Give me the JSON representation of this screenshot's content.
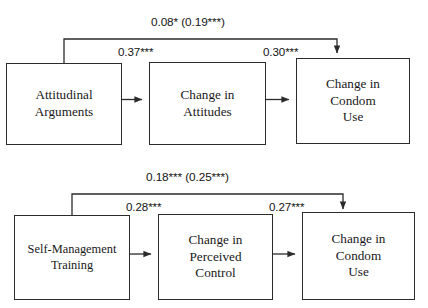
{
  "diagram": {
    "type": "path-diagram",
    "panels": [
      {
        "id": "panel-attitudinal",
        "nodes": [
          {
            "id": "attitudinal-arguments",
            "label": "Attitudinal\nArguments"
          },
          {
            "id": "change-in-attitudes",
            "label": "Change in\nAttitudes"
          },
          {
            "id": "change-in-condom-use",
            "label": "Change in\nCondom\nUse"
          }
        ],
        "paths": [
          {
            "id": "direct-effect",
            "from": "attitudinal-arguments",
            "to": "change-in-condom-use",
            "label": "0.08* (0.19***)"
          },
          {
            "id": "a-path",
            "from": "attitudinal-arguments",
            "to": "change-in-attitudes",
            "label": "0.37***"
          },
          {
            "id": "b-path",
            "from": "change-in-attitudes",
            "to": "change-in-condom-use",
            "label": "0.30***"
          }
        ]
      },
      {
        "id": "panel-self-management",
        "nodes": [
          {
            "id": "self-management-training",
            "label": "Self-Management\nTraining"
          },
          {
            "id": "change-in-perceived-control",
            "label": "Change in\nPerceived\nControl"
          },
          {
            "id": "change-in-condom-use-2",
            "label": "Change in\nCondom\nUse"
          }
        ],
        "paths": [
          {
            "id": "direct-effect-2",
            "from": "self-management-training",
            "to": "change-in-condom-use-2",
            "label": "0.18*** (0.25***)"
          },
          {
            "id": "a-path-2",
            "from": "self-management-training",
            "to": "change-in-perceived-control",
            "label": "0.28***"
          },
          {
            "id": "b-path-2",
            "from": "change-in-perceived-control",
            "to": "change-in-condom-use-2",
            "label": "0.27***"
          }
        ]
      }
    ],
    "colors": {
      "line": "#2b2b2b",
      "text": "#181818",
      "background": "#ffffff"
    }
  }
}
